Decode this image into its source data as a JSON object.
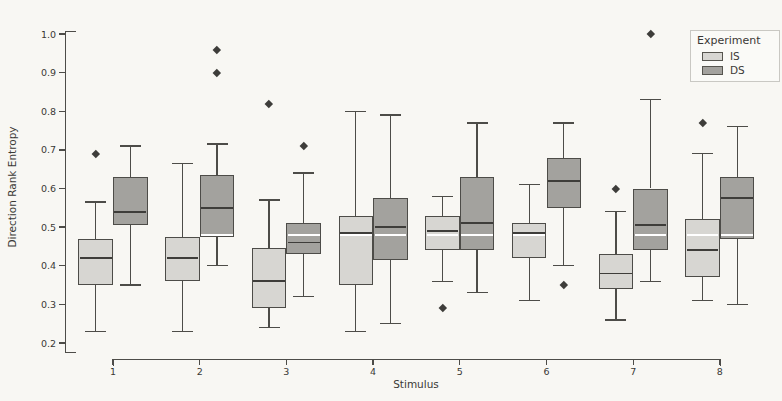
{
  "chart_data": {
    "type": "boxplot",
    "title": "",
    "xlabel": "Stimulus",
    "ylabel": "Direction Rank Entropy",
    "categories": [
      1,
      2,
      3,
      4,
      5,
      6,
      7,
      8
    ],
    "ylim": [
      0.2,
      1.0
    ],
    "yticks": [
      0.2,
      0.3,
      0.4,
      0.5,
      0.6,
      0.7,
      0.8,
      0.9,
      1.0
    ],
    "grid": false,
    "legend": {
      "title": "Experiment",
      "position": "upper-right"
    },
    "reference_line": {
      "value": 0.48,
      "color": "#ffffff"
    },
    "colors": {
      "edge": "#4d4c48",
      "median": "#3e3d3a",
      "outlier": "#3e3d3a"
    },
    "series": [
      {
        "name": "IS",
        "fill": "#d7d6d2",
        "boxes": [
          {
            "stimulus": 1,
            "whisker_low": 0.23,
            "q1": 0.35,
            "median": 0.42,
            "q3": 0.47,
            "whisker_high": 0.565,
            "outliers": [
              0.69
            ]
          },
          {
            "stimulus": 2,
            "whisker_low": 0.23,
            "q1": 0.36,
            "median": 0.42,
            "q3": 0.475,
            "whisker_high": 0.665,
            "outliers": []
          },
          {
            "stimulus": 3,
            "whisker_low": 0.24,
            "q1": 0.29,
            "median": 0.36,
            "q3": 0.445,
            "whisker_high": 0.57,
            "outliers": [
              0.82
            ]
          },
          {
            "stimulus": 4,
            "whisker_low": 0.23,
            "q1": 0.35,
            "median": 0.485,
            "q3": 0.53,
            "whisker_high": 0.8,
            "outliers": []
          },
          {
            "stimulus": 5,
            "whisker_low": 0.36,
            "q1": 0.44,
            "median": 0.49,
            "q3": 0.53,
            "whisker_high": 0.58,
            "outliers": [
              0.29
            ]
          },
          {
            "stimulus": 6,
            "whisker_low": 0.31,
            "q1": 0.42,
            "median": 0.485,
            "q3": 0.51,
            "whisker_high": 0.61,
            "outliers": []
          },
          {
            "stimulus": 7,
            "whisker_low": 0.26,
            "q1": 0.34,
            "median": 0.38,
            "q3": 0.43,
            "whisker_high": 0.54,
            "outliers": [
              0.6
            ]
          },
          {
            "stimulus": 8,
            "whisker_low": 0.31,
            "q1": 0.37,
            "median": 0.44,
            "q3": 0.52,
            "whisker_high": 0.69,
            "outliers": [
              0.77
            ]
          }
        ]
      },
      {
        "name": "DS",
        "fill": "#a3a29e",
        "boxes": [
          {
            "stimulus": 1,
            "whisker_low": 0.35,
            "q1": 0.505,
            "median": 0.54,
            "q3": 0.63,
            "whisker_high": 0.71,
            "outliers": []
          },
          {
            "stimulus": 2,
            "whisker_low": 0.4,
            "q1": 0.475,
            "median": 0.55,
            "q3": 0.635,
            "whisker_high": 0.715,
            "outliers": [
              0.9,
              0.96
            ]
          },
          {
            "stimulus": 3,
            "whisker_low": 0.32,
            "q1": 0.43,
            "median": 0.46,
            "q3": 0.51,
            "whisker_high": 0.64,
            "outliers": [
              0.71
            ]
          },
          {
            "stimulus": 4,
            "whisker_low": 0.25,
            "q1": 0.415,
            "median": 0.5,
            "q3": 0.575,
            "whisker_high": 0.79,
            "outliers": []
          },
          {
            "stimulus": 5,
            "whisker_low": 0.33,
            "q1": 0.44,
            "median": 0.51,
            "q3": 0.63,
            "whisker_high": 0.77,
            "outliers": []
          },
          {
            "stimulus": 6,
            "whisker_low": 0.4,
            "q1": 0.55,
            "median": 0.62,
            "q3": 0.68,
            "whisker_high": 0.77,
            "outliers": [
              0.35
            ]
          },
          {
            "stimulus": 7,
            "whisker_low": 0.36,
            "q1": 0.44,
            "median": 0.505,
            "q3": 0.6,
            "whisker_high": 0.83,
            "outliers": [
              1.0
            ]
          },
          {
            "stimulus": 8,
            "whisker_low": 0.3,
            "q1": 0.47,
            "median": 0.575,
            "q3": 0.63,
            "whisker_high": 0.76,
            "outliers": []
          }
        ]
      }
    ]
  }
}
